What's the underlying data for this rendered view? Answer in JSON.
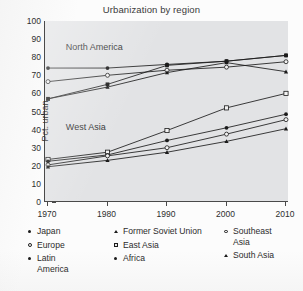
{
  "chart_data": {
    "type": "line",
    "title": "Urbanization by region",
    "xlabel": "",
    "ylabel": "Pct. urban",
    "x": [
      1970,
      1980,
      1990,
      2000,
      2010
    ],
    "xtick_labels": [
      "1970",
      "1980",
      "1990",
      "2000",
      "2010"
    ],
    "ytick_labels": [
      "0",
      "10",
      "20",
      "30",
      "40",
      "50",
      "60",
      "70",
      "80",
      "90",
      "100"
    ],
    "xlim": [
      1970,
      2010
    ],
    "ylim": [
      0,
      100
    ],
    "ytick_step": 10,
    "grid": false,
    "legend_position": "below",
    "plot_background": "#e2e3e5",
    "line_color": "#1b1b1b",
    "annotations": [
      {
        "text": "North America",
        "x": 1973,
        "y": 85
      },
      {
        "text": "West Asia",
        "x": 1973,
        "y": 41
      }
    ],
    "series": [
      {
        "name": "Japan",
        "marker": "filled-circle",
        "values": [
          74.0,
          74.0,
          76.0,
          77.8,
          81.0
        ]
      },
      {
        "name": "Europe",
        "marker": "open-circle",
        "values": [
          66.5,
          70.0,
          72.8,
          74.5,
          77.5
        ]
      },
      {
        "name": "Latin America",
        "marker": "filled-square",
        "values": [
          57.0,
          65.0,
          75.5,
          77.8,
          81.0
        ]
      },
      {
        "name": "Former Soviet Union",
        "marker": "triangle",
        "values": [
          57.0,
          63.5,
          71.5,
          77.0,
          72.0
        ]
      },
      {
        "name": "East Asia",
        "marker": "open-square",
        "values": [
          23.5,
          27.5,
          39.5,
          52.0,
          60.0
        ]
      },
      {
        "name": "Africa",
        "marker": "filled-circle",
        "values": [
          22.5,
          26.0,
          34.0,
          41.0,
          48.5
        ]
      },
      {
        "name": "Southeast Asia",
        "marker": "open-circle",
        "values": [
          20.5,
          25.5,
          30.0,
          37.5,
          45.5
        ]
      },
      {
        "name": "South Asia",
        "marker": "triangle",
        "values": [
          19.5,
          23.0,
          27.5,
          33.5,
          40.5
        ]
      }
    ]
  },
  "legend": {
    "columns": [
      [
        {
          "label": "Japan",
          "marker": "filled-circle",
          "cont": ""
        },
        {
          "label": "Europe",
          "marker": "open-circle",
          "cont": ""
        },
        {
          "label": "Latin",
          "marker": "filled-circle",
          "cont": "America"
        }
      ],
      [
        {
          "label": "Former Soviet Union",
          "marker": "triangle",
          "cont": ""
        },
        {
          "label": "East Asia",
          "marker": "open-square",
          "cont": ""
        },
        {
          "label": "Africa",
          "marker": "filled-circle",
          "cont": ""
        }
      ],
      [
        {
          "label": "Southeast",
          "marker": "open-circle",
          "cont": "Asia"
        },
        {
          "label": "South Asia",
          "marker": "triangle",
          "cont": ""
        }
      ]
    ]
  }
}
